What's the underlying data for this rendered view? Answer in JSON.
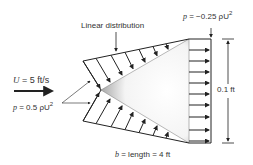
{
  "diagram": {
    "title_label": "Linear distribution",
    "pressure_top": {
      "prefix": "p",
      "text": " = −0.25 ρU",
      "sup": "2"
    },
    "velocity": {
      "prefix": "U",
      "text": " = 5 ft/s"
    },
    "pressure_tip": {
      "prefix": "p",
      "text": " = 0.5 ρU",
      "sup": "2"
    },
    "height_label": "0.1 ft",
    "length_label": {
      "prefix": "b",
      "text": " = length = 4 ft"
    },
    "colors": {
      "line": "#222222",
      "shade_dark": "#9a9a9a",
      "shade_light": "#ffffff"
    }
  }
}
